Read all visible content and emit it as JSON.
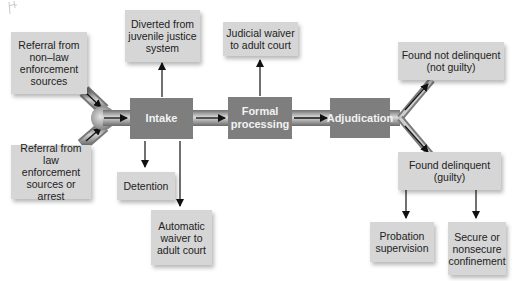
{
  "diagram": {
    "type": "flowchart",
    "colors": {
      "stage_fill": "#7e7e7e",
      "stage_text": "#f2f2f2",
      "outcome_fill": "#d6d6d6",
      "outcome_text": "#222222",
      "pipe": "#8a8a8a",
      "arrow": "#111111"
    },
    "sources": {
      "non_law": "Referral from non–law enforcement sources",
      "law": "Referral from law enforcement sources or arrest"
    },
    "stages": {
      "intake": "Intake",
      "formal": "Formal processing",
      "adjudication": "Adjudication"
    },
    "outcomes": {
      "diverted": "Diverted from juvenile justice system",
      "judicial_waiver": "Judicial waiver to adult court",
      "detention": "Detention",
      "automatic_waiver": "Automatic waiver to adult court",
      "not_delinquent": "Found not delinquent (not guilty)",
      "delinquent": "Found delinquent (guilty)",
      "probation": "Probation supervision",
      "confinement": "Secure or nonsecure confinement"
    },
    "edges": [
      [
        "non_law",
        "intake"
      ],
      [
        "law",
        "intake"
      ],
      [
        "intake",
        "diverted"
      ],
      [
        "intake",
        "detention"
      ],
      [
        "intake",
        "automatic_waiver"
      ],
      [
        "intake",
        "formal"
      ],
      [
        "formal",
        "judicial_waiver"
      ],
      [
        "formal",
        "adjudication"
      ],
      [
        "adjudication",
        "not_delinquent"
      ],
      [
        "adjudication",
        "delinquent"
      ],
      [
        "delinquent",
        "probation"
      ],
      [
        "delinquent",
        "confinement"
      ]
    ]
  }
}
